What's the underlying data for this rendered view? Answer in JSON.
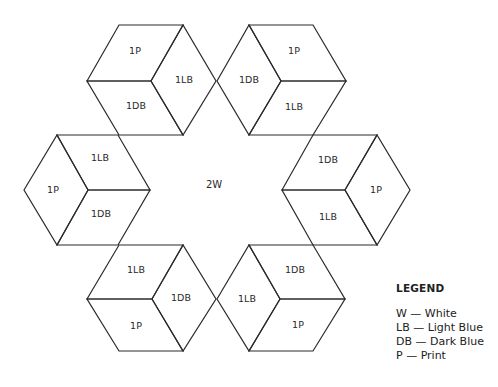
{
  "diagram": {
    "center_label": "2W",
    "cubes": [
      {
        "name": "top-left",
        "faces": [
          {
            "label": "1P",
            "points": "87,81 119,25 183,25 151,81",
            "lx": 135,
            "ly": 51
          },
          {
            "label": "1LB",
            "points": "151,81 183,25 216,81 183,135",
            "lx": 184,
            "ly": 80
          },
          {
            "label": "1DB",
            "points": "87,81 151,81 183,135 119,135",
            "lx": 136,
            "ly": 106
          }
        ]
      },
      {
        "name": "top-right",
        "faces": [
          {
            "label": "1DB",
            "points": "217,81 249,25 281,81 249,135",
            "lx": 249,
            "ly": 80
          },
          {
            "label": "1P",
            "points": "249,25 313,25 346,81 281,81",
            "lx": 294,
            "ly": 51
          },
          {
            "label": "1LB",
            "points": "281,81 346,81 313,135 249,135",
            "lx": 294,
            "ly": 107
          }
        ]
      },
      {
        "name": "left",
        "faces": [
          {
            "label": "1P",
            "points": "24,190 57,135 88,190 57,245",
            "lx": 53,
            "ly": 190
          },
          {
            "label": "1LB",
            "points": "57,135 118,135 150,190 88,190",
            "lx": 100,
            "ly": 158
          },
          {
            "label": "1DB",
            "points": "88,190 150,190 118,245 57,245",
            "lx": 101,
            "ly": 214
          }
        ]
      },
      {
        "name": "right",
        "faces": [
          {
            "label": "1DB",
            "points": "282,190 313,135 377,135 345,190",
            "lx": 328,
            "ly": 160
          },
          {
            "label": "1P",
            "points": "345,190 377,135 410,190 377,245",
            "lx": 376,
            "ly": 190
          },
          {
            "label": "1LB",
            "points": "282,190 345,190 377,245 313,245",
            "lx": 328,
            "ly": 217
          }
        ]
      },
      {
        "name": "bottom-left",
        "faces": [
          {
            "label": "1LB",
            "points": "87,299 119,245 183,245 152,299",
            "lx": 136,
            "ly": 270
          },
          {
            "label": "1DB",
            "points": "152,299 183,245 216,299 183,351",
            "lx": 181,
            "ly": 298
          },
          {
            "label": "1P",
            "points": "87,299 152,299 183,351 119,351",
            "lx": 136,
            "ly": 326
          }
        ]
      },
      {
        "name": "bottom-right",
        "faces": [
          {
            "label": "1LB",
            "points": "217,299 249,245 280,299 249,351",
            "lx": 247,
            "ly": 299
          },
          {
            "label": "1DB",
            "points": "249,245 313,245 345,299 280,299",
            "lx": 295,
            "ly": 270
          },
          {
            "label": "1P",
            "points": "280,299 345,299 313,351 249,351",
            "lx": 298,
            "ly": 325
          }
        ]
      }
    ]
  },
  "legend": {
    "title": "LEGEND",
    "entries": [
      {
        "code": "W",
        "meaning": "White",
        "text": "W — White"
      },
      {
        "code": "LB",
        "meaning": "Light Blue",
        "text": "LB — Light  Blue"
      },
      {
        "code": "DB",
        "meaning": "Dark Blue",
        "text": "DB — Dark  Blue"
      },
      {
        "code": "P",
        "meaning": "Print",
        "text": "P — Print"
      }
    ]
  }
}
